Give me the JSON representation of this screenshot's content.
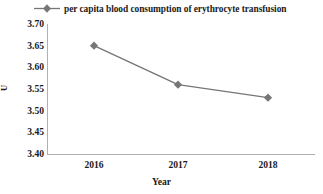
{
  "chart_data": {
    "type": "line",
    "title": "",
    "categories": [
      "2016",
      "2017",
      "2018"
    ],
    "series": [
      {
        "name": "per capita blood consumption of erythrocyte transfusion",
        "values": [
          3.65,
          3.56,
          3.53
        ]
      }
    ],
    "xlabel": "Year",
    "ylabel": "U",
    "ylim": [
      3.4,
      3.7
    ],
    "yticks": [
      "3.70",
      "3.65",
      "3.60",
      "3.55",
      "3.50",
      "3.45",
      "3.40"
    ],
    "ytick_values": [
      3.7,
      3.65,
      3.6,
      3.55,
      3.5,
      3.45,
      3.4
    ],
    "grid": false,
    "legend_position": "top",
    "marker": "diamond",
    "series_color": "#767676",
    "axis_color": "#b0b0b0",
    "text_color": "#1a1a1a"
  },
  "legend": {
    "marker_name": "diamond-marker",
    "label": "per capita blood consumption of erythrocyte transfusion"
  },
  "axes": {
    "y_title": "U",
    "x_title": "Year"
  }
}
